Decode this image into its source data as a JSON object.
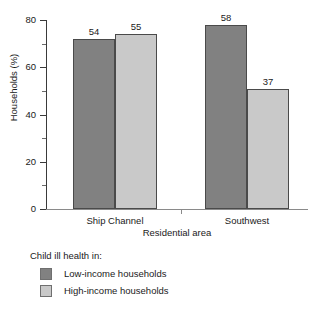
{
  "chart_data": {
    "type": "bar",
    "title": "",
    "xlabel": "Residential area",
    "ylabel": "Households (%)",
    "categories": [
      "Ship Channel",
      "Southwest"
    ],
    "series": [
      {
        "name": "Low-income households",
        "color": "#818181",
        "values": [
          72,
          78
        ],
        "data_labels": [
          "54",
          "58"
        ]
      },
      {
        "name": "High-income households",
        "color": "#c9c9c9",
        "values": [
          74,
          51
        ],
        "data_labels": [
          "55",
          "37"
        ]
      }
    ],
    "ylim": [
      0,
      80
    ],
    "yticks": [
      0,
      20,
      40,
      60,
      80
    ],
    "ytick_labels": [
      "0",
      "20",
      "40",
      "60",
      "80"
    ],
    "yminor_ticks": [
      10,
      30,
      50,
      70
    ],
    "grid": false,
    "legend_position": "below",
    "legend_title": "Child ill health in:"
  }
}
